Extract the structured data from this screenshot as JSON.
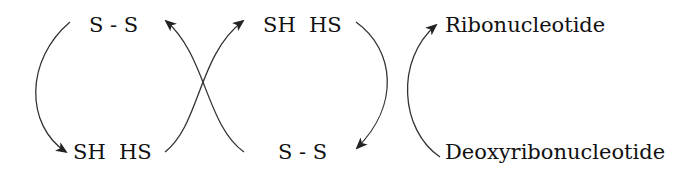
{
  "diagram": {
    "type": "coupled redox cycle",
    "nodes": {
      "left_top": "S - S",
      "left_bottom": "SH  HS",
      "mid_top": "SH  HS",
      "mid_bottom": "S - S",
      "right_top": "Ribonucleotide",
      "right_bottom": "Deoxyribonucleotide"
    },
    "arrows": [
      {
        "from": "left_top",
        "to": "left_bottom",
        "label": ""
      },
      {
        "from": "left_bottom",
        "to": "mid_top",
        "label": ""
      },
      {
        "from": "mid_bottom",
        "to": "left_top",
        "label": ""
      },
      {
        "from": "mid_top",
        "to": "mid_bottom",
        "label": ""
      },
      {
        "from": "right_bottom",
        "to": "right_top",
        "label": ""
      }
    ],
    "colors": {
      "stroke": "#333333",
      "text": "#111111",
      "background": "#ffffff"
    }
  }
}
